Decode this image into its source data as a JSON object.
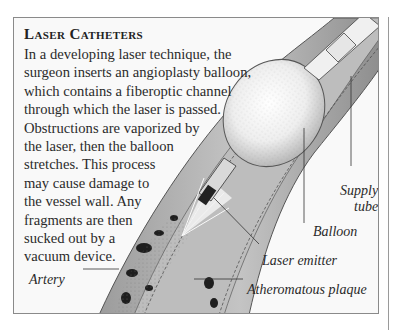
{
  "article": {
    "title": "Laser Catheters",
    "body_lines": [
      "In a developing laser technique, the",
      "surgeon inserts an angioplasty balloon,",
      "which contains a fiberoptic channel",
      "through which the laser is passed.",
      "Obstructions are vaporized by",
      "the laser, then the balloon",
      "stretches. This process",
      "may cause damage to",
      "the vessel wall. Any",
      "fragments are then",
      "sucked out by a",
      "vacuum device."
    ]
  },
  "illustration": {
    "subject": "laser-angioplasty-catheter-in-artery",
    "labels": {
      "supply_tube_line1": "Supply",
      "supply_tube_line2": "tube",
      "balloon": "Balloon",
      "laser_emitter": "Laser emitter",
      "atheromatous_plaque": "Atheromatous plaque",
      "artery": "Artery"
    }
  }
}
